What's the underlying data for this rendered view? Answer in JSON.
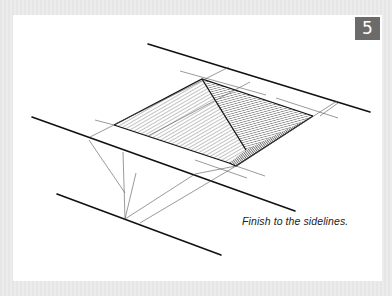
{
  "figure": {
    "step_number": "5",
    "caption": "Finish to the sidelines.",
    "colors": {
      "badge_background": "#6b6b6b",
      "badge_text": "#ffffff",
      "panel_background": "#ffffff",
      "ink": "#1a1a1a"
    },
    "drawing": {
      "subject": "pen sketch of a recessed pyramid-shaped hole between parallel sidelines, with hatched faces and construction lines",
      "icon": "sketch-illustration"
    }
  }
}
